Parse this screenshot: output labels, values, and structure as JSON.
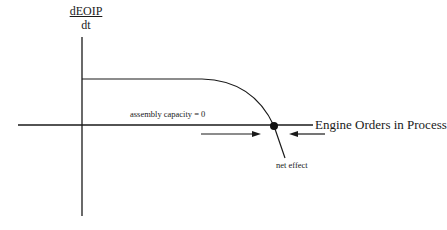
{
  "diagram": {
    "y_axis_label": {
      "numerator": "dEOIP",
      "denominator": "dt"
    },
    "x_axis_label": "Engine Orders in Process",
    "annotations": {
      "capacity": "assembly capacity = 0",
      "net_effect": "net effect"
    },
    "colors": {
      "line": "#1a1a1a",
      "background": "#ffffff"
    }
  }
}
